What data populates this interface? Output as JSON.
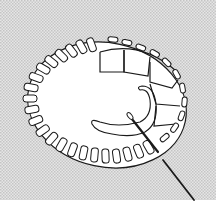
{
  "illustration": {
    "subject": "buttonhole-stitch-embroidery",
    "colors": {
      "background": "#ffffff",
      "halftone": "#d4d4d4",
      "fabric": "#ffffff",
      "line": "#1a1a1a"
    }
  }
}
